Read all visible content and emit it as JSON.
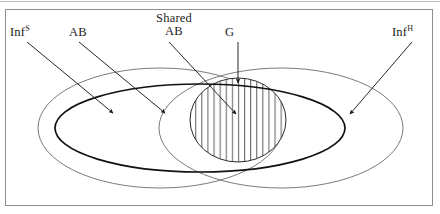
{
  "figure": {
    "kind": "venn-diagram",
    "background_color": "#ffffff",
    "frame_color": "#8e8e8e",
    "line_color_thin": "#5a5a5a",
    "line_color_bold": "#111111",
    "hatch_color": "#4d4d4d",
    "arrow_color": "#1a1a1a"
  },
  "labels": {
    "inf_s": {
      "base": "Inf",
      "sup": "S",
      "name": "Inf superscript S"
    },
    "ab": {
      "text": "AB"
    },
    "shared_ab": {
      "line1": "Shared",
      "line2": "AB"
    },
    "g": {
      "text": "G"
    },
    "inf_h": {
      "base": "Inf",
      "sup": "H",
      "name": "Inf superscript H"
    }
  },
  "regions": {
    "left_ellipse": {
      "label": "Inf S",
      "cx": 160,
      "cy": 128,
      "rx": 122,
      "ry": 60
    },
    "right_ellipse": {
      "label": "Inf H",
      "cx": 281,
      "cy": 128,
      "rx": 122,
      "ry": 60
    },
    "ab_ellipse": {
      "label": "AB",
      "cx": 200,
      "cy": 128,
      "rx": 145,
      "ry": 44
    },
    "shared_region": {
      "label": "Shared AB",
      "cx": 238,
      "cy": 120,
      "rx": 48,
      "ry": 42,
      "fill": "vertical-hatch"
    },
    "g_region": {
      "label": "G"
    }
  },
  "arrows": [
    {
      "from_label": "Inf S",
      "x1": 27,
      "y1": 42,
      "x2": 113,
      "y2": 113
    },
    {
      "from_label": "AB",
      "x1": 79,
      "y1": 42,
      "x2": 165,
      "y2": 113
    },
    {
      "from_label": "Shared AB",
      "x1": 169,
      "y1": 42,
      "x2": 236,
      "y2": 114
    },
    {
      "from_label": "G",
      "x1": 238,
      "y1": 42,
      "x2": 238,
      "y2": 83
    },
    {
      "from_label": "Inf H",
      "x1": 412,
      "y1": 42,
      "x2": 350,
      "y2": 114
    }
  ]
}
